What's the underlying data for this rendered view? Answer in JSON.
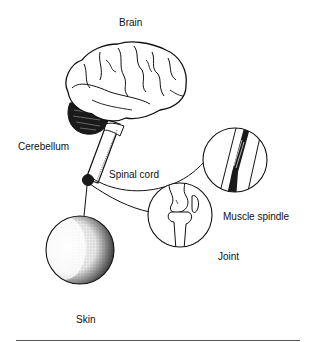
{
  "diagram": {
    "labels": {
      "brain": "Brain",
      "cerebellum": "Cerebellum",
      "spinal_cord": "Spinal cord",
      "muscle_spindle": "Muscle spindle",
      "joint": "Joint",
      "skin": "Skin"
    },
    "colors": {
      "ink": "#111111",
      "background": "#ffffff",
      "rule": "#555555"
    }
  }
}
